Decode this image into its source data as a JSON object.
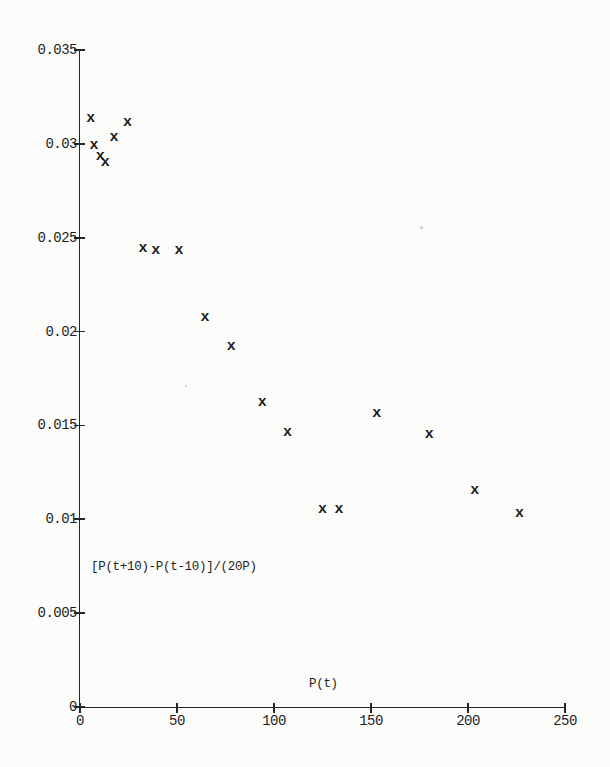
{
  "page": {
    "background": "#fcfcfa",
    "ink": "#262626",
    "artifacts": [
      {
        "x_px": 420,
        "y_px": 226,
        "size_px": 3
      },
      {
        "x_px": 185,
        "y_px": 385,
        "size_px": 2
      }
    ]
  },
  "chart_data": {
    "type": "scatter",
    "title": "",
    "xlabel": "P(t)",
    "ylabel": "[P(t+10)-P(t-10)]/(20P)",
    "marker_glyph": "x",
    "grid": false,
    "legend": null,
    "xlim": [
      0,
      250
    ],
    "ylim": [
      0,
      0.035
    ],
    "x_ticks": [
      {
        "value": 0,
        "label": "0"
      },
      {
        "value": 50,
        "label": "50"
      },
      {
        "value": 100,
        "label": "100"
      },
      {
        "value": 150,
        "label": "150"
      },
      {
        "value": 200,
        "label": "200"
      },
      {
        "value": 250,
        "label": "250"
      }
    ],
    "y_ticks": [
      {
        "value": 0,
        "label": "0"
      },
      {
        "value": 0.005,
        "label": "0.005"
      },
      {
        "value": 0.01,
        "label": "0.01"
      },
      {
        "value": 0.015,
        "label": "0.015"
      },
      {
        "value": 0.02,
        "label": "0.02"
      },
      {
        "value": 0.025,
        "label": "0.025"
      },
      {
        "value": 0.03,
        "label": "0.03"
      },
      {
        "value": 0.035,
        "label": "0.035"
      }
    ],
    "points": [
      {
        "x": 5.5,
        "y": 0.0313
      },
      {
        "x": 7.2,
        "y": 0.0299
      },
      {
        "x": 10.5,
        "y": 0.0293
      },
      {
        "x": 13.0,
        "y": 0.029
      },
      {
        "x": 17.5,
        "y": 0.0303
      },
      {
        "x": 24.5,
        "y": 0.0311
      },
      {
        "x": 32.5,
        "y": 0.0244
      },
      {
        "x": 39.0,
        "y": 0.0243
      },
      {
        "x": 51.0,
        "y": 0.0243
      },
      {
        "x": 64.5,
        "y": 0.0207
      },
      {
        "x": 78.0,
        "y": 0.0192
      },
      {
        "x": 94.0,
        "y": 0.0162
      },
      {
        "x": 107.0,
        "y": 0.0146
      },
      {
        "x": 125.0,
        "y": 0.0105
      },
      {
        "x": 133.5,
        "y": 0.0105
      },
      {
        "x": 153.0,
        "y": 0.0156
      },
      {
        "x": 180.0,
        "y": 0.0145
      },
      {
        "x": 203.5,
        "y": 0.0115
      },
      {
        "x": 226.5,
        "y": 0.0103
      }
    ]
  }
}
